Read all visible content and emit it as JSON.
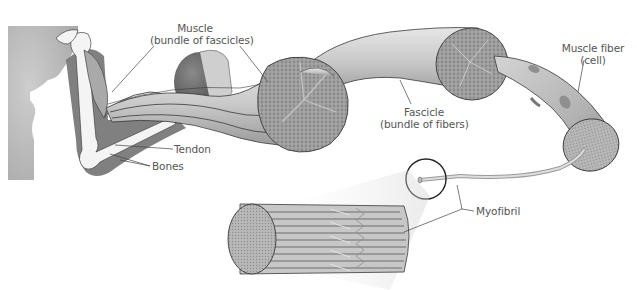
{
  "diagram": {
    "labels": {
      "muscle": {
        "line1": "Muscle",
        "line2": "(bundle of fascicles)"
      },
      "fascicle": {
        "line1": "Fascicle",
        "line2": "(bundle of fibers)"
      },
      "muscle_fiber": {
        "line1": "Muscle fiber",
        "line2": "(cell)"
      },
      "tendon": "Tendon",
      "bones": "Bones",
      "myofibril": "Myofibril"
    },
    "hierarchy": [
      "Muscle",
      "Fascicle",
      "Muscle fiber",
      "Myofibril"
    ],
    "colors": {
      "background": "#ffffff",
      "tissue_light": "#d9d9d9",
      "tissue_mid": "#a8a8a8",
      "tissue_dark": "#6e6e6e",
      "bone": "#f2f2f2",
      "outline": "#333333",
      "label_text": "#555555",
      "leader_line": "#444444"
    }
  }
}
